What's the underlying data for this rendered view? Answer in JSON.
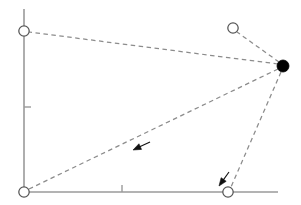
{
  "figure": {
    "title": "",
    "width": 301,
    "height": 205,
    "background_color": "#ffffff"
  },
  "chart_data": {
    "type": "scatter",
    "title": "",
    "xlabel": "",
    "ylabel": "",
    "grid": false,
    "legend": null,
    "xlim": [
      0,
      301
    ],
    "ylim": [
      0,
      205
    ],
    "axes": {
      "y_axis": {
        "x": 24,
        "y_top": 9,
        "y_bottom": 193,
        "color": "#9a9a9a",
        "width": 1.6
      },
      "x_axis": {
        "y": 192,
        "x_left": 24,
        "x_right": 278,
        "color": "#9a9a9a",
        "width": 1.6
      },
      "ticks": [
        {
          "name": "y-tick",
          "axis": "y",
          "x1": 24,
          "y1": 107,
          "x2": 31,
          "y2": 107
        },
        {
          "name": "x-tick",
          "axis": "x",
          "x1": 122,
          "y1": 192,
          "x2": 122,
          "y2": 185
        }
      ]
    },
    "points": [
      {
        "id": "p-top-left",
        "label": "",
        "x": 24,
        "y": 31,
        "marker": "open-circle",
        "r": 5.2,
        "fill": "#ffffff",
        "stroke": "#555555"
      },
      {
        "id": "p-bottom-left",
        "label": "",
        "x": 24,
        "y": 192,
        "marker": "open-circle",
        "r": 5.2,
        "fill": "#ffffff",
        "stroke": "#555555"
      },
      {
        "id": "p-top-right",
        "label": "",
        "x": 233,
        "y": 28,
        "marker": "open-circle",
        "r": 5.2,
        "fill": "#ffffff",
        "stroke": "#555555"
      },
      {
        "id": "p-bottom-right",
        "label": "",
        "x": 228,
        "y": 192,
        "marker": "open-circle",
        "r": 5.2,
        "fill": "#ffffff",
        "stroke": "#555555"
      },
      {
        "id": "p-hub",
        "label": "",
        "x": 283,
        "y": 66,
        "marker": "filled-circle",
        "r": 6.0,
        "fill": "#000000",
        "stroke": "#000000"
      }
    ],
    "connectors": [
      {
        "id": "c-hub-top-left",
        "from": "p-hub",
        "to": "p-top-left",
        "x1": 278,
        "y1": 64,
        "x2": 29,
        "y2": 32,
        "style": "dashed",
        "color": "#8c8c8c"
      },
      {
        "id": "c-hub-top-right",
        "from": "p-hub",
        "to": "p-top-right",
        "x1": 279,
        "y1": 62,
        "x2": 237,
        "y2": 32,
        "style": "dashed",
        "color": "#8c8c8c"
      },
      {
        "id": "c-hub-bottom-left",
        "from": "p-hub",
        "to": "p-bottom-left",
        "x1": 278,
        "y1": 69,
        "x2": 29,
        "y2": 189,
        "style": "dashed",
        "color": "#8c8c8c"
      },
      {
        "id": "c-hub-bottom-right",
        "from": "p-hub",
        "to": "p-bottom-right",
        "x1": 281,
        "y1": 72,
        "x2": 231,
        "y2": 187,
        "style": "dashed",
        "color": "#8c8c8c"
      }
    ],
    "arrows": [
      {
        "id": "arrow-middle",
        "on_connector": "c-hub-bottom-left",
        "tip_x": 133,
        "tip_y": 150,
        "tail_x": 150,
        "tail_y": 142,
        "direction": "left-down",
        "color": "#111111",
        "style": "solid"
      },
      {
        "id": "arrow-bottom-right",
        "on_connector": "c-hub-bottom-right",
        "tip_x": 219,
        "tip_y": 186,
        "tail_x": 229,
        "tail_y": 172,
        "direction": "down-left",
        "color": "#111111",
        "style": "solid"
      }
    ]
  }
}
